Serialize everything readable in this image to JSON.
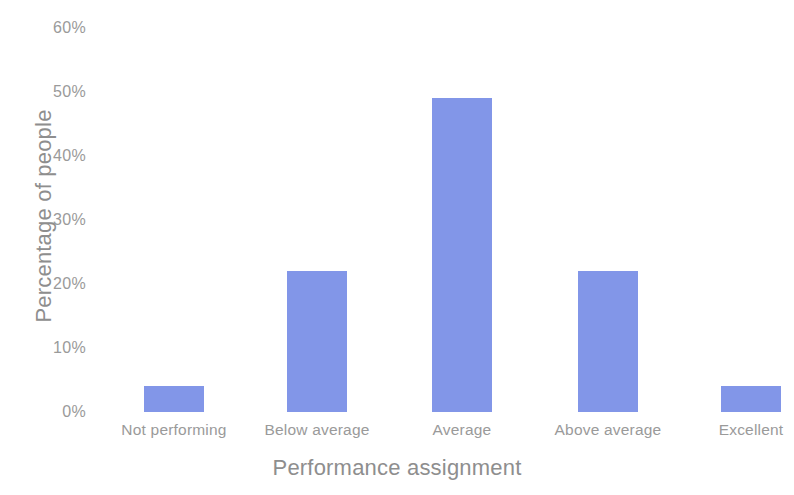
{
  "chart_data": {
    "type": "bar",
    "title": "",
    "subtitle": "",
    "xlabel": "Performance assignment",
    "ylabel": "Percentage of people",
    "categories": [
      "Not performing",
      "Below average",
      "Average",
      "Above average",
      "Excellent"
    ],
    "values": [
      4,
      22,
      49,
      22,
      4
    ],
    "value_labels": [
      "4%",
      "22%",
      "49%",
      "22%",
      "4%"
    ],
    "ylim": [
      0,
      60
    ],
    "ytick_values": [
      60,
      50,
      40,
      30,
      20,
      10,
      0
    ],
    "ytick_labels": [
      "60%",
      "50%",
      "40%",
      "30%",
      "20%",
      "10%",
      "0%"
    ],
    "grid": false,
    "legend": null,
    "legend_position": "none",
    "bar_color": "#8296e8",
    "axis_text_color": "#9a9a9a",
    "axis_title_color": "#8e8e8e",
    "background_color": "#ffffff",
    "annotations": []
  }
}
